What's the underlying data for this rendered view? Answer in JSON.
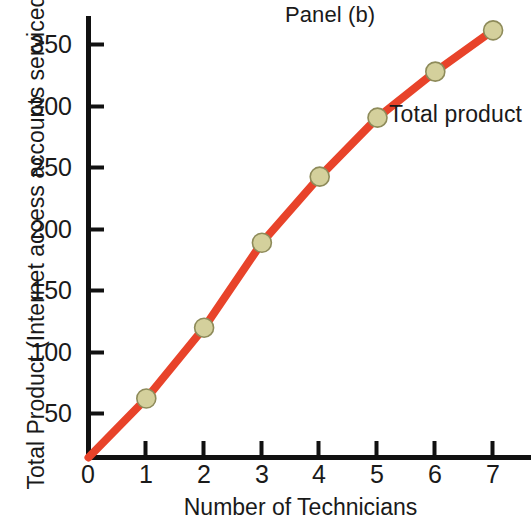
{
  "panel": {
    "title": "Panel (b)"
  },
  "annotation": {
    "series_label": "Total product"
  },
  "axes": {
    "x_title": "Number of Technicians",
    "y_title": "Total Product (Internet access accounts serviced)",
    "x_ticks": [
      "0",
      "1",
      "2",
      "3",
      "4",
      "5",
      "6",
      "7"
    ],
    "y_ticks": [
      "50",
      "100",
      "150",
      "200",
      "250",
      "300",
      "350"
    ]
  },
  "colors": {
    "line": "#E8432A",
    "marker_fill": "#D4D09C",
    "marker_stroke": "#8E8B5A",
    "axis": "#111111",
    "text": "#1a1a1a",
    "background": "#ffffff"
  },
  "chart_data": {
    "type": "line",
    "title": "Panel (b)",
    "xlabel": "Number of Technicians",
    "ylabel": "Total Product (Internet access accounts serviced)",
    "xlim": [
      0,
      7.6
    ],
    "ylim": [
      0,
      375
    ],
    "grid": false,
    "legend": "none",
    "annotations": [
      {
        "text": "Total product",
        "x": 5.2,
        "y": 295
      }
    ],
    "x": [
      0,
      1,
      2,
      3,
      4,
      5,
      6,
      7
    ],
    "values": [
      0,
      50,
      110,
      182,
      238,
      288,
      327,
      362
    ],
    "series": [
      {
        "name": "Total product",
        "x": [
          0,
          1,
          2,
          3,
          4,
          5,
          6,
          7
        ],
        "values": [
          0,
          50,
          110,
          182,
          238,
          288,
          327,
          362
        ],
        "marker_points": [
          {
            "x": 1,
            "y": 50
          },
          {
            "x": 2,
            "y": 110
          },
          {
            "x": 3,
            "y": 182
          },
          {
            "x": 4,
            "y": 238
          },
          {
            "x": 5,
            "y": 288
          },
          {
            "x": 6,
            "y": 327
          },
          {
            "x": 7,
            "y": 362
          }
        ]
      }
    ],
    "x_tick_values": [
      0,
      1,
      2,
      3,
      4,
      5,
      6,
      7
    ],
    "y_tick_values": [
      50,
      100,
      150,
      200,
      250,
      300,
      350
    ]
  }
}
